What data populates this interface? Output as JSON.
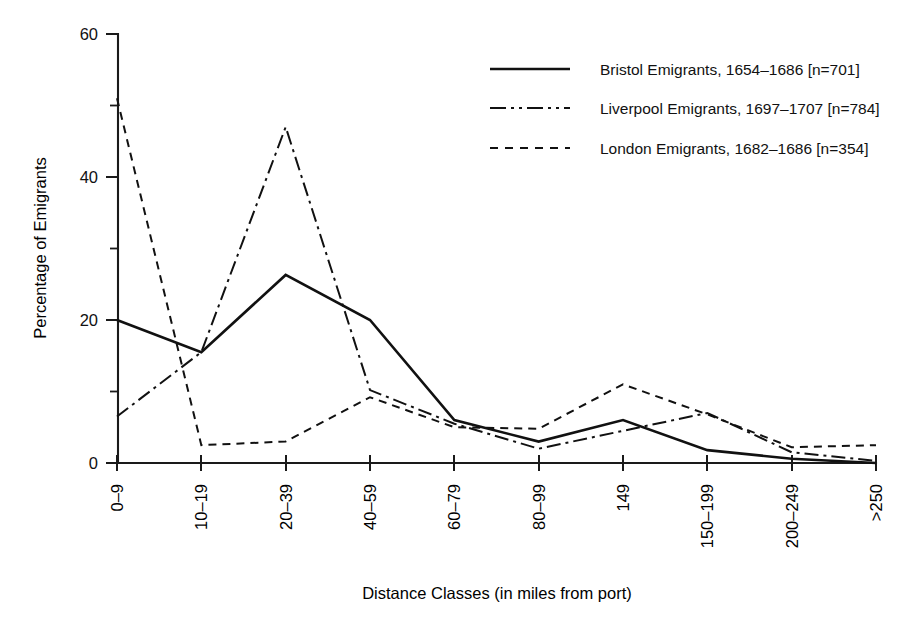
{
  "chart_data": {
    "type": "line",
    "title": "",
    "xlabel": "Distance Classes (in miles from port)",
    "ylabel": "Percentage of Emigrants",
    "categories": [
      "0–9",
      "10–19",
      "20–39",
      "40–59",
      "60–79",
      "80–99",
      "149",
      "150–199",
      "200–249",
      ">250"
    ],
    "ylim": [
      0,
      60
    ],
    "yticks": [
      0,
      20,
      40,
      60
    ],
    "yticks_minor": [
      10,
      30,
      50
    ],
    "ytick_labels": [
      "0",
      "20",
      "40",
      "60"
    ],
    "grid": false,
    "legend_position": "top-right",
    "series": [
      {
        "name": "Bristol Emigrants, 1654–1686 [n=701]",
        "style": "solid",
        "values": [
          20,
          15.5,
          26.3,
          20,
          6,
          3,
          6,
          1.8,
          0.6,
          0
        ]
      },
      {
        "name": "Liverpool Emigrants, 1697–1707 [n=784]",
        "style": "dash-dot",
        "values": [
          6.5,
          15.5,
          47,
          10.2,
          5.5,
          2,
          4.5,
          7,
          1.5,
          0.3
        ]
      },
      {
        "name": "London Emigrants, 1682–1686 [n=354]",
        "style": "dashed",
        "values": [
          51,
          2.5,
          3,
          9.2,
          5,
          4.8,
          11,
          6.8,
          2.2,
          2.5
        ]
      }
    ]
  },
  "axes": {
    "y_title": "Percentage of Emigrants",
    "x_title": "Distance Classes (in miles from port)",
    "y_tick_0": "0",
    "y_tick_20": "20",
    "y_tick_40": "40",
    "y_tick_60": "60",
    "x_tick_0": "0–9",
    "x_tick_1": "10–19",
    "x_tick_2": "20–39",
    "x_tick_3": "40–59",
    "x_tick_4": "60–79",
    "x_tick_5": "80–99",
    "x_tick_6": "149",
    "x_tick_7": "150–199",
    "x_tick_8": "200–249",
    "x_tick_9": ">250"
  },
  "legend": {
    "items": [
      {
        "label": "Bristol Emigrants, 1654–1686 [n=701]",
        "style": "solid"
      },
      {
        "label": "Liverpool Emigrants, 1697–1707 [n=784]",
        "style": "dash-dot"
      },
      {
        "label": "London Emigrants, 1682–1686 [n=354]",
        "style": "dashed"
      }
    ]
  },
  "colors": {
    "ink": "#111111",
    "background": "#ffffff"
  }
}
